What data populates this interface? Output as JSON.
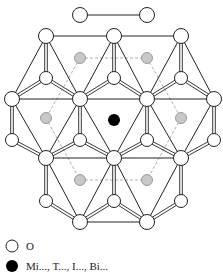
{
  "diagram": {
    "colors": {
      "line": "#222222",
      "anion_fill": "#ffffff",
      "gray_cation": "#c8c8c8",
      "black_cation": "#000000",
      "dashed": "#999999"
    },
    "large_anions": [
      [
        80,
        15
      ],
      [
        147,
        15
      ],
      [
        46,
        36
      ],
      [
        114,
        36
      ],
      [
        181,
        36
      ],
      [
        12,
        99
      ],
      [
        80,
        99
      ],
      [
        147,
        99
      ],
      [
        214,
        99
      ],
      [
        46,
        158
      ],
      [
        114,
        158
      ],
      [
        181,
        158
      ],
      [
        80,
        222
      ],
      [
        147,
        222
      ]
    ],
    "small_anions": [
      [
        46,
        78
      ],
      [
        114,
        78
      ],
      [
        181,
        78
      ],
      [
        12,
        140
      ],
      [
        80,
        140
      ],
      [
        147,
        140
      ],
      [
        214,
        140
      ],
      [
        46,
        201
      ],
      [
        114,
        201
      ],
      [
        181,
        201
      ]
    ],
    "gray_cations": [
      [
        80,
        58
      ],
      [
        147,
        58
      ],
      [
        46,
        118
      ],
      [
        181,
        118
      ],
      [
        80,
        180
      ],
      [
        147,
        180
      ]
    ],
    "black_cation": [
      114,
      120
    ]
  },
  "legend": {
    "items": [
      {
        "symbol": "open-circle",
        "label": "O"
      },
      {
        "symbol": "black-circle",
        "label": "Mi..., T..., I..., Bi..."
      }
    ]
  }
}
